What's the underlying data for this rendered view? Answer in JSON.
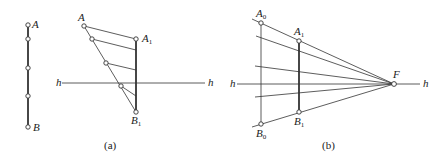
{
  "figure": {
    "panel_a": {
      "caption": "(a)",
      "segment_labels": {
        "top": "A",
        "bottom": "B"
      },
      "oblique_label": "A",
      "projected_top": {
        "base": "A",
        "sub": "1"
      },
      "projected_bottom": {
        "base": "B",
        "sub": "1"
      },
      "horizon_left": "h",
      "horizon_right": "h"
    },
    "panel_b": {
      "caption": "(b)",
      "top_far": {
        "base": "A",
        "sub": "0"
      },
      "bottom_far": {
        "base": "B",
        "sub": "0"
      },
      "top_near": {
        "base": "A",
        "sub": "1"
      },
      "bottom_near": {
        "base": "B",
        "sub": "1"
      },
      "vanishing_point": "F",
      "horizon_left": "h",
      "horizon_right": "h"
    }
  }
}
